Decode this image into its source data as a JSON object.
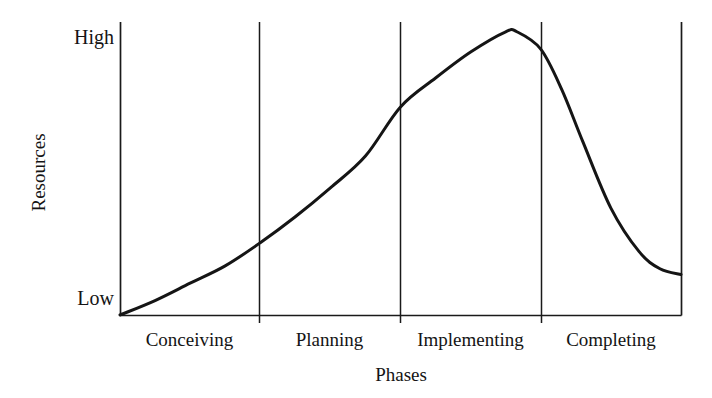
{
  "chart_data": {
    "type": "line",
    "title": "",
    "subtitle": "",
    "xlabel": "Phases",
    "ylabel": "Resources",
    "grid": false,
    "legend": false,
    "legend_position": "none",
    "categories": [
      "Conceiving",
      "Planning",
      "Implementing",
      "Completing"
    ],
    "y_tick_labels": [
      "Low",
      "High"
    ],
    "ylim": [
      0,
      100
    ],
    "xlim": [
      0,
      4
    ],
    "axis_style": "two-vertical-spines-with-phase-dividers",
    "annotations": [],
    "series": [
      {
        "name": "Resource loading",
        "shape": "skewed-bell",
        "x": [
          0.0,
          0.25,
          0.5,
          0.75,
          1.0,
          1.25,
          1.5,
          1.75,
          2.0,
          2.25,
          2.5,
          2.75,
          2.83,
          3.0,
          3.15,
          3.3,
          3.5,
          3.7,
          3.85,
          4.0
        ],
        "values": [
          0,
          5,
          11,
          17,
          25,
          34,
          44,
          55,
          72,
          82,
          91,
          98,
          98,
          92,
          78,
          60,
          37,
          22,
          16,
          14
        ],
        "x_labels": [
          "Start",
          "",
          "",
          "",
          "Conceiving/Planning",
          "",
          "",
          "",
          "Planning/Implementing",
          "",
          "",
          "",
          "Peak",
          "Implementing/Completing",
          "",
          "",
          "",
          "",
          "",
          "End"
        ],
        "peak": {
          "x": 2.83,
          "y": 98,
          "label": "High"
        },
        "start": {
          "x": 0.0,
          "y": 0,
          "label": "Low"
        },
        "end": {
          "x": 4.0,
          "y": 14
        }
      }
    ],
    "colors": {
      "curve": "#151515",
      "axis": "#1a1a1a",
      "divider": "#1a1a1a",
      "background": "#ffffff",
      "text": "#141414"
    }
  },
  "axes": {
    "y_title": "Resources",
    "x_title": "Phases",
    "y_ticks": [
      {
        "label": "High",
        "value": 100
      },
      {
        "label": "Low",
        "value": 0
      }
    ]
  },
  "phases": [
    {
      "label": "Conceiving"
    },
    {
      "label": "Planning"
    },
    {
      "label": "Implementing"
    },
    {
      "label": "Completing"
    }
  ]
}
